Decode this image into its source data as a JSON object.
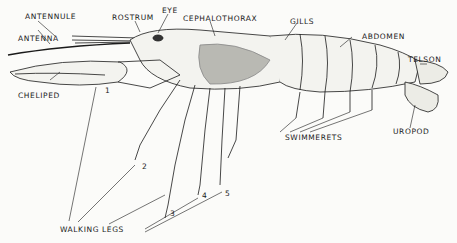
{
  "diagram": {
    "labels": {
      "antennule": "ANTENNULE",
      "antenna": "ANTENNA",
      "rostrum": "ROSTRUM",
      "eye": "EYE",
      "cephalothorax": "CEPHALOTHORAX",
      "gills": "GILLS",
      "abdomen": "ABDOMEN",
      "telson": "TELSON",
      "cheliped": "CHELIPED",
      "swimmerets": "SWIMMERETS",
      "uropod": "UROPOD",
      "walking_legs": "WALKING LEGS"
    },
    "leg_numbers": [
      "1",
      "2",
      "3",
      "4",
      "5"
    ],
    "colors": {
      "background": "#fbfbf9",
      "ink": "#1a1a1a",
      "gill_shading": "#9a9a9a"
    }
  }
}
